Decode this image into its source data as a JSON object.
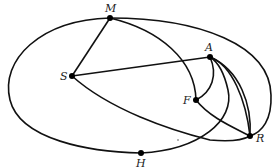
{
  "diagram": {
    "type": "graph",
    "nodes": [
      {
        "id": "M",
        "label": "M",
        "x": 110,
        "y": 18
      },
      {
        "id": "S",
        "label": "S",
        "x": 72,
        "y": 76
      },
      {
        "id": "A",
        "label": "A",
        "x": 210,
        "y": 57
      },
      {
        "id": "F",
        "label": "F",
        "x": 196,
        "y": 100
      },
      {
        "id": "R",
        "label": "R",
        "x": 250,
        "y": 136
      },
      {
        "id": "H",
        "label": "H",
        "x": 141,
        "y": 153
      }
    ],
    "edges": [
      [
        "M",
        "H"
      ],
      [
        "M",
        "R"
      ],
      [
        "M",
        "S"
      ],
      [
        "M",
        "F"
      ],
      [
        "S",
        "A"
      ],
      [
        "S",
        "R"
      ],
      [
        "A",
        "F"
      ],
      [
        "A",
        "R"
      ],
      [
        "A",
        "R"
      ],
      [
        "H",
        "A"
      ],
      [
        "F",
        "R"
      ]
    ]
  }
}
